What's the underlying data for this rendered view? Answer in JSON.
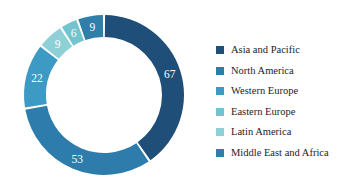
{
  "chart_data": {
    "type": "pie",
    "variant": "donut",
    "title": "",
    "subtitle": "",
    "xlabel": "",
    "ylabel": "",
    "legend_position": "right",
    "grid": false,
    "total": 166,
    "start_angle_deg": 0,
    "direction": "clockwise",
    "categories": [
      "Asia and Pacific",
      "North America",
      "Western Europe",
      "Eastern Europe",
      "Latin America",
      "Middle East and Africa"
    ],
    "values": [
      67,
      53,
      22,
      6,
      9,
      9
    ],
    "slices": [
      {
        "label": "Asia and Pacific",
        "value": 67,
        "value_text": "67",
        "color": "#1f4e79"
      },
      {
        "label": "North America",
        "value": 53,
        "value_text": "53",
        "color": "#2e7cab"
      },
      {
        "label": "Western Europe",
        "value": 22,
        "value_text": "22",
        "color": "#3d9ac4"
      },
      {
        "label": "Eastern Europe",
        "value": 6,
        "value_text": "6",
        "color": "#73c4cf"
      },
      {
        "label": "Latin America",
        "value": 9,
        "value_text": "9",
        "color": "#8dd0d6"
      },
      {
        "label": "Middle East and Africa",
        "value": 9,
        "value_text": "9",
        "color": "#2f7fa8"
      }
    ],
    "draw_order_clockwise": [
      {
        "label": "Asia and Pacific",
        "value": 67,
        "value_text": "67",
        "color": "#1f4e79"
      },
      {
        "label": "North America",
        "value": 53,
        "value_text": "53",
        "color": "#2e7cab"
      },
      {
        "label": "Western Europe",
        "value": 22,
        "value_text": "22",
        "color": "#3d9ac4"
      },
      {
        "label": "Latin America",
        "value": 9,
        "value_text": "9",
        "color": "#8dd0d6"
      },
      {
        "label": "Eastern Europe",
        "value": 6,
        "value_text": "6",
        "color": "#73c4cf"
      },
      {
        "label": "Middle East and Africa",
        "value": 9,
        "value_text": "9",
        "color": "#2f7fa8"
      }
    ]
  },
  "legend": {
    "items": [
      {
        "label": "Asia and Pacific",
        "color": "#1f4e79"
      },
      {
        "label": "North America",
        "color": "#2e7cab"
      },
      {
        "label": "Western Europe",
        "color": "#3d9ac4"
      },
      {
        "label": "Eastern Europe",
        "color": "#73c4cf"
      },
      {
        "label": "Latin America",
        "color": "#8dd0d6"
      },
      {
        "label": "Middle East and Africa",
        "color": "#2f7fa8"
      }
    ]
  },
  "geometry": {
    "center_x": 90,
    "center_y": 87,
    "outer_radius": 80,
    "inner_radius": 58,
    "gap_deg": 1.6
  },
  "colors": {
    "background": "#ffffff",
    "label_text": "#ffffff",
    "legend_text": "#1d1d1d",
    "separator": "#ffffff"
  }
}
